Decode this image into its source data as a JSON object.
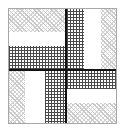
{
  "figure": {
    "width": 123,
    "height": 134,
    "background_color": "#ffffff",
    "frame": {
      "x": 8,
      "y": 8,
      "width": 109,
      "height": 116,
      "border_color": "#a8a8a8",
      "border_width": 1
    },
    "dividers": {
      "color": "#121212",
      "thickness": 2,
      "vertical_x": 56,
      "horizontal_y": 60
    },
    "fills": {
      "hatch_label": "light-diagonal-hatch",
      "hatch_color": "#c9c9c9",
      "cross_label": "dark-crosshatch",
      "cross_color": "#4a4a4a",
      "white_label": "plain-white",
      "white_color": "#ffffff"
    },
    "quadrants": [
      {
        "name": "top-left",
        "x": 0,
        "y": 0,
        "width": 56,
        "height": 60,
        "orientation": "horizontal-bands",
        "bands": [
          {
            "fill": "hatch",
            "offset": 0,
            "size": 23
          },
          {
            "fill": "white",
            "offset": 23,
            "size": 14
          },
          {
            "fill": "cross",
            "offset": 37,
            "size": 23
          }
        ]
      },
      {
        "name": "top-right",
        "x": 58,
        "y": 0,
        "width": 51,
        "height": 60,
        "orientation": "vertical-bands",
        "bands": [
          {
            "fill": "cross",
            "offset": 0,
            "size": 17
          },
          {
            "fill": "white",
            "offset": 17,
            "size": 17
          },
          {
            "fill": "hatch",
            "offset": 34,
            "size": 17
          }
        ]
      },
      {
        "name": "bottom-left",
        "x": 0,
        "y": 62,
        "width": 56,
        "height": 54,
        "orientation": "vertical-bands",
        "bands": [
          {
            "fill": "hatch",
            "offset": 0,
            "size": 16
          },
          {
            "fill": "white",
            "offset": 16,
            "size": 20
          },
          {
            "fill": "cross",
            "offset": 36,
            "size": 20
          }
        ]
      },
      {
        "name": "bottom-right",
        "x": 58,
        "y": 62,
        "width": 51,
        "height": 54,
        "orientation": "horizontal-bands",
        "bands": [
          {
            "fill": "cross",
            "offset": 0,
            "size": 18
          },
          {
            "fill": "white",
            "offset": 18,
            "size": 14
          },
          {
            "fill": "hatch",
            "offset": 32,
            "size": 22
          }
        ]
      }
    ]
  }
}
